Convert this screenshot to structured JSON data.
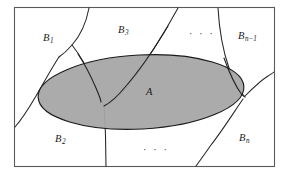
{
  "figure": {
    "frame": {
      "x": 14,
      "y": 7,
      "width": 261,
      "height": 160,
      "stroke": "#4d4d4d",
      "fill": "#ffffff"
    },
    "ellipse": {
      "label": "A",
      "cx": 141,
      "cy": 92,
      "rx": 103,
      "ry": 37,
      "rotation": -3,
      "fill": "#a6a6a6",
      "stroke": "#1a1a1a"
    },
    "curve_stroke": "#262626",
    "regions": [
      {
        "name": "B1",
        "base": "B",
        "sub": "1",
        "sub_prefix": "",
        "sub_op": "",
        "sub_suffix": "",
        "x": 43,
        "y": 33
      },
      {
        "name": "B3",
        "base": "B",
        "sub": "3",
        "sub_prefix": "",
        "sub_op": "",
        "sub_suffix": "",
        "x": 118,
        "y": 25
      },
      {
        "name": "Bn-1",
        "base": "B",
        "sub": "",
        "sub_prefix": "n",
        "sub_op": "−",
        "sub_suffix": "1",
        "x": 238,
        "y": 31
      },
      {
        "name": "B2",
        "base": "B",
        "sub": "2",
        "sub_prefix": "",
        "sub_op": "",
        "sub_suffix": "",
        "x": 55,
        "y": 134
      },
      {
        "name": "Bn",
        "base": "B",
        "sub": "n",
        "sub_prefix": "",
        "sub_op": "",
        "sub_suffix": "",
        "x": 239,
        "y": 133
      }
    ],
    "ellipsis_marks": [
      {
        "name": "top-ellipsis",
        "text": "· · ·",
        "x": 189,
        "y": 29
      },
      {
        "name": "bottom-ellipsis",
        "text": "· · ·",
        "x": 143,
        "y": 145
      }
    ],
    "set_label": {
      "text": "A",
      "x": 146,
      "y": 87
    }
  }
}
